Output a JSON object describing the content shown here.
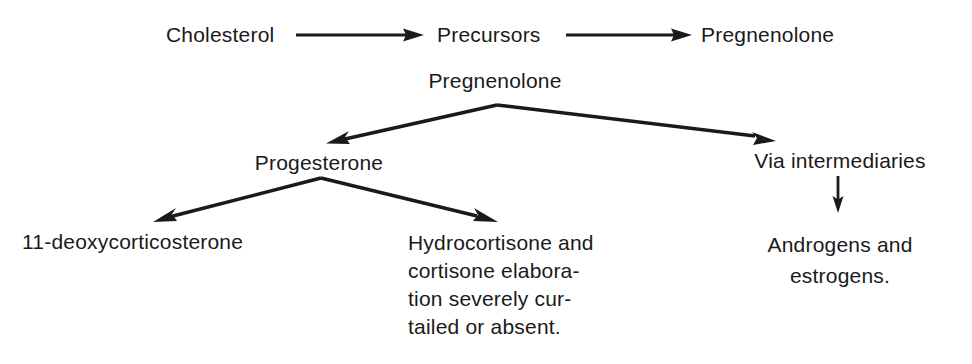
{
  "diagram": {
    "background_color": "#ffffff",
    "ink_color": "#1a1a1a",
    "nodes": {
      "cholesterol": "Cholesterol",
      "precursors": "Precursors",
      "pregnenolone_top": "Pregnenolone",
      "pregnenolone_main": "Pregnenolone",
      "progesterone": "Progesterone",
      "via_intermediaries": "Via intermediaries",
      "deoxycorticosterone": "11-deoxycorticosterone"
    },
    "hydrocortisone_block": {
      "line1": "Hydrocortisone and",
      "line2": "cortisone elabora-",
      "line3": "tion severely cur-",
      "line4": "tailed or absent."
    },
    "androgens_block": {
      "line1": "Androgens and",
      "line2": "estrogens."
    },
    "arrows": [
      {
        "name": "cholesterol-to-precursors",
        "from": "Cholesterol",
        "to": "Precursors",
        "direction": "right"
      },
      {
        "name": "precursors-to-pregnenolone",
        "from": "Precursors",
        "to": "Pregnenolone",
        "direction": "right"
      },
      {
        "name": "pregnenolone-to-progesterone",
        "from": "Pregnenolone",
        "to": "Progesterone",
        "direction": "down-left"
      },
      {
        "name": "pregnenolone-to-via-intermediaries",
        "from": "Pregnenolone",
        "to": "Via intermediaries",
        "direction": "down-right"
      },
      {
        "name": "progesterone-to-deoxycorticosterone",
        "from": "Progesterone",
        "to": "11-deoxycorticosterone",
        "direction": "down-left"
      },
      {
        "name": "progesterone-to-hydrocortisone",
        "from": "Progesterone",
        "to": "Hydrocortisone and cortisone elaboration severely curtailed or absent.",
        "direction": "down-right"
      },
      {
        "name": "via-intermediaries-to-androgens",
        "from": "Via intermediaries",
        "to": "Androgens and estrogens.",
        "direction": "down"
      }
    ]
  }
}
